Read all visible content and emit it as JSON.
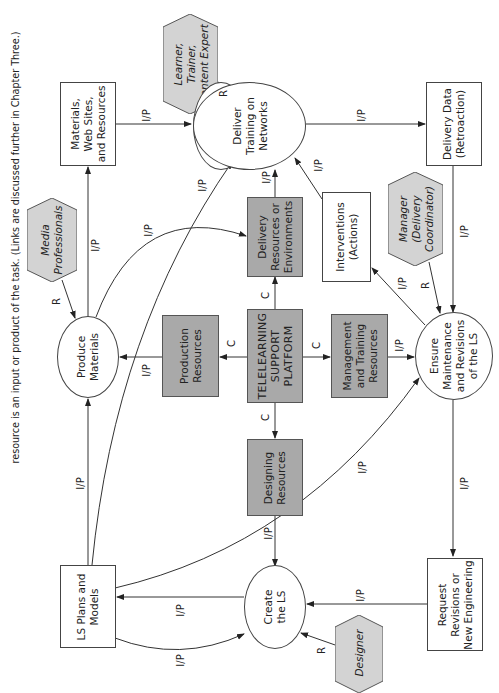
{
  "caption": "resource is an input or product of the task. (Links are discussed further in Chapter Three.)",
  "colors": {
    "resource_fill": "#a9a9a9",
    "actor_fill": "#d3d3d3",
    "line": "#333333"
  },
  "nodes": {
    "materials": {
      "type": "product",
      "lines": [
        "Materials,",
        "Web Sites,",
        "and Resources"
      ]
    },
    "media_professionals": {
      "type": "actor",
      "lines": [
        "Media",
        "Professionals"
      ]
    },
    "learner": {
      "type": "actor",
      "lines": [
        "Learner,",
        "Trainer,",
        "Content Expert"
      ]
    },
    "deliver_training": {
      "type": "process",
      "lines": [
        "Deliver",
        "Training on",
        "Networks"
      ]
    },
    "delivery_data": {
      "type": "product",
      "lines": [
        "Delivery Data",
        "(Retroaction)"
      ]
    },
    "produce_materials": {
      "type": "process",
      "lines": [
        "Produce",
        "Materials"
      ]
    },
    "production_resources": {
      "type": "resource",
      "lines": [
        "Production",
        "Resources"
      ]
    },
    "delivery_resources": {
      "type": "resource",
      "lines": [
        "Delivery",
        "Resources or",
        "Environments"
      ]
    },
    "platform": {
      "type": "resource",
      "lines": [
        "TELELEARNING",
        "SUPPORT",
        "PLATFORM"
      ]
    },
    "interventions": {
      "type": "product",
      "lines": [
        "Interventions",
        "(Actions)"
      ]
    },
    "manager": {
      "type": "actor",
      "lines": [
        "Manager",
        "(Delivery",
        "Coordinator)"
      ]
    },
    "management_resources": {
      "type": "resource",
      "lines": [
        "Management",
        "and Training",
        "Resources"
      ]
    },
    "ensure": {
      "type": "process",
      "lines": [
        "Ensure",
        "Maintenance",
        "and Revisions",
        "of the LS"
      ]
    },
    "designing_resources": {
      "type": "resource",
      "lines": [
        "Designing",
        "Resources"
      ]
    },
    "ls_plans": {
      "type": "product",
      "lines": [
        "LS Plans and",
        "Models"
      ]
    },
    "create_ls": {
      "type": "process",
      "lines": [
        "Create",
        "the LS"
      ]
    },
    "request": {
      "type": "product",
      "lines": [
        "Request",
        "Revisions or",
        "New Engineering"
      ]
    },
    "designer": {
      "type": "actor",
      "lines": [
        "Designer"
      ]
    }
  },
  "links": {
    "ip": "I/P",
    "c": "C",
    "r": "R"
  }
}
